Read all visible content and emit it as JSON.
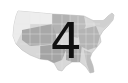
{
  "map": {
    "subject": "United States map (grayscale)",
    "overlay_number": "4",
    "colors": {
      "land_light": "#e4e4e4",
      "land_mid": "#b8b8b8",
      "land_dark": "#9a9a9a",
      "border": "#ffffff",
      "number": "#111111"
    }
  }
}
